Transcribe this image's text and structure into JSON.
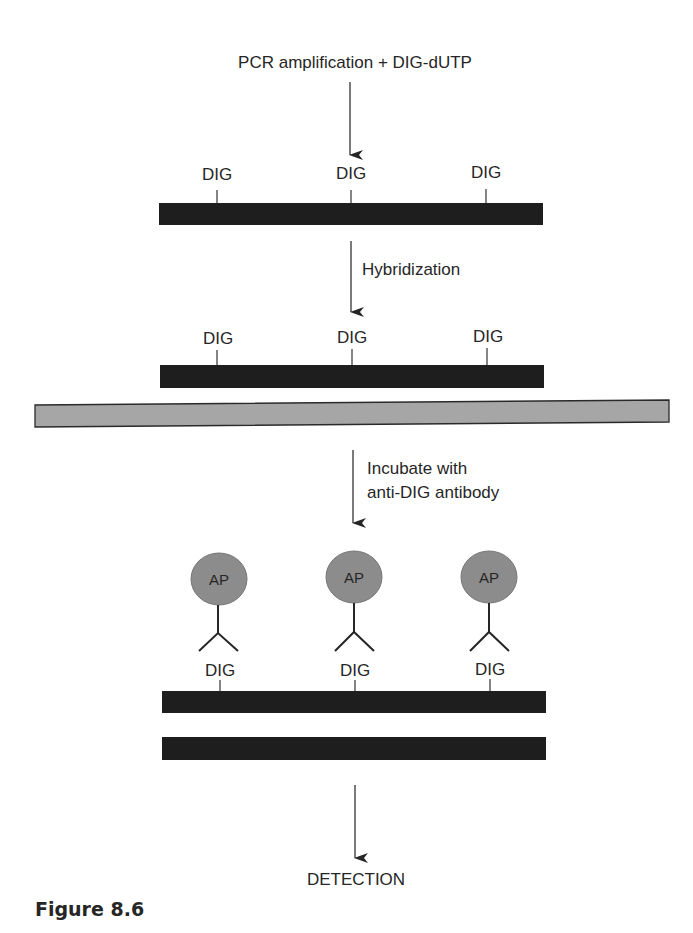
{
  "diagram": {
    "title": "PCR amplification + DIG-dUTP",
    "steps": {
      "hybridization": "Hybridization",
      "incubate_line1": "Incubate with",
      "incubate_line2": "anti-DIG antibody",
      "detection": "DETECTION"
    },
    "label_dig": "DIG",
    "label_ap": "AP",
    "probe_rows": [
      {
        "id": "labeled-probe",
        "dig_labels": [
          "DIG",
          "DIG",
          "DIG"
        ]
      },
      {
        "id": "hybridized-probe",
        "dig_labels": [
          "DIG",
          "DIG",
          "DIG"
        ]
      },
      {
        "id": "antibody-bound-probe",
        "dig_labels": [
          "DIG",
          "DIG",
          "DIG"
        ],
        "ap_labels": [
          "AP",
          "AP",
          "AP"
        ]
      }
    ],
    "colors": {
      "strand": "#1e1e1e",
      "membrane": "#a6a6a6",
      "ap_enzyme": "#8c8c8c",
      "text": "#262626"
    }
  },
  "caption": "Figure 8.6"
}
